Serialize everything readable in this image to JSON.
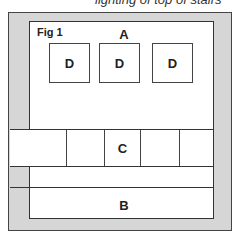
{
  "caption": "lighting of top of stairs",
  "figure": {
    "label": "Fig 1",
    "regions": {
      "A": "A",
      "B": "B",
      "C": "C",
      "D": [
        "D",
        "D",
        "D"
      ]
    }
  }
}
